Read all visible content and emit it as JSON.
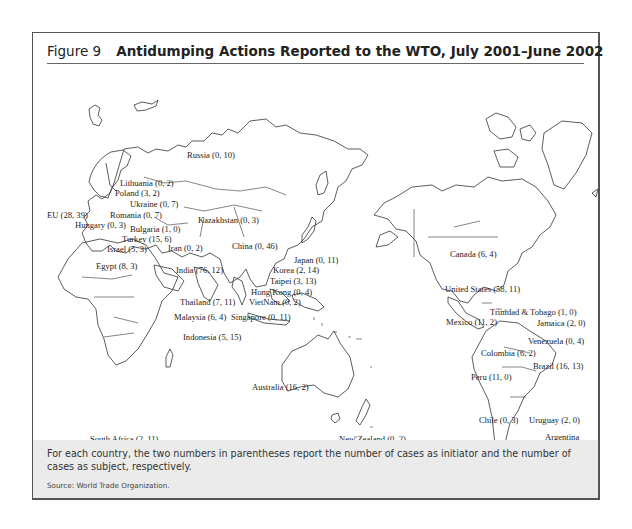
{
  "figure": {
    "number": "Figure 9",
    "title": "Antidumping Actions Reported to the WTO, July 2001–June 2002"
  },
  "map": {
    "type": "world-outline-map",
    "value_format": "(initiator cases, subject cases)",
    "labels": [
      {
        "id": "russia",
        "name": "Russia",
        "initiator": 0,
        "subject": 10,
        "text": "Russia (0, 10)"
      },
      {
        "id": "lithuania",
        "name": "Lithuania",
        "initiator": 0,
        "subject": 2,
        "text": "Lithuania (0, 2)"
      },
      {
        "id": "poland",
        "name": "Poland",
        "initiator": 3,
        "subject": 2,
        "text": "Poland (3, 2)"
      },
      {
        "id": "ukraine",
        "name": "Ukraine",
        "initiator": 0,
        "subject": 7,
        "text": "Ukraine (0, 7)"
      },
      {
        "id": "eu",
        "name": "EU",
        "initiator": 28,
        "subject": 39,
        "text": "EU (28, 39)"
      },
      {
        "id": "romania",
        "name": "Romania",
        "initiator": 0,
        "subject": 7,
        "text": "Romania (0, 7)"
      },
      {
        "id": "hungary",
        "name": "Hungary",
        "initiator": 0,
        "subject": 3,
        "text": "Hungary (0, 3)"
      },
      {
        "id": "kazakhstan",
        "name": "Kazakhstan",
        "initiator": 0,
        "subject": 3,
        "text": "Kazakhstan (0, 3)"
      },
      {
        "id": "bulgaria",
        "name": "Bulgaria",
        "initiator": 1,
        "subject": 0,
        "text": "Bulgaria (1, 0)"
      },
      {
        "id": "turkey",
        "name": "Turkey",
        "initiator": 15,
        "subject": 6,
        "text": "Turkey (15, 6)"
      },
      {
        "id": "israel",
        "name": "Israel",
        "initiator": 5,
        "subject": 3,
        "text": "Israel (5, 3)"
      },
      {
        "id": "iran",
        "name": "Iran",
        "initiator": 0,
        "subject": 2,
        "text": "Iran (0, 2)"
      },
      {
        "id": "china",
        "name": "China",
        "initiator": 0,
        "subject": 46,
        "text": "China (0, 46)"
      },
      {
        "id": "japan",
        "name": "Japan",
        "initiator": 0,
        "subject": 11,
        "text": "Japan (0, 11)"
      },
      {
        "id": "egypt",
        "name": "Egypt",
        "initiator": 8,
        "subject": 3,
        "text": "Egypt (8, 3)"
      },
      {
        "id": "india",
        "name": "India",
        "initiator": 76,
        "subject": 12,
        "text": "India (76, 12)"
      },
      {
        "id": "korea",
        "name": "Korea",
        "initiator": 2,
        "subject": 14,
        "text": "Korea (2, 14)"
      },
      {
        "id": "taipei",
        "name": "Taipei",
        "initiator": 3,
        "subject": 13,
        "text": "Taipei (3, 13)"
      },
      {
        "id": "hongkong",
        "name": "Hong Kong",
        "initiator": 0,
        "subject": 4,
        "text": "Hong Kong (0, 4)"
      },
      {
        "id": "thailand",
        "name": "Thailand",
        "initiator": 7,
        "subject": 11,
        "text": "Thailand (7, 11)"
      },
      {
        "id": "vietnam",
        "name": "VietNam",
        "initiator": 0,
        "subject": 2,
        "text": "VietNam (0, 2)"
      },
      {
        "id": "malaysia",
        "name": "Malaysia",
        "initiator": 6,
        "subject": 4,
        "text": "Malaysia (6, 4)"
      },
      {
        "id": "singapore",
        "name": "Singapore",
        "initiator": 0,
        "subject": 11,
        "text": "Singapore (0, 11)"
      },
      {
        "id": "indonesia",
        "name": "Indonesia",
        "initiator": 5,
        "subject": 15,
        "text": "Indonesia (5, 15)"
      },
      {
        "id": "australia",
        "name": "Australia",
        "initiator": 16,
        "subject": 2,
        "text": "Australia (16, 2)"
      },
      {
        "id": "southafrica",
        "name": "South Africa",
        "initiator": 2,
        "subject": 11,
        "text": "South Africa (2, 11)"
      },
      {
        "id": "newzealand",
        "name": "New Zealand",
        "initiator": 0,
        "subject": 2,
        "text": "New Zealand (0, 2)"
      },
      {
        "id": "canada",
        "name": "Canada",
        "initiator": 6,
        "subject": 4,
        "text": "Canada (6, 4)"
      },
      {
        "id": "unitedstates",
        "name": "United States",
        "initiator": 58,
        "subject": 11,
        "text": "United States (58, 11)"
      },
      {
        "id": "trinidad",
        "name": "Trinidad & Tobago",
        "initiator": 1,
        "subject": 0,
        "text": "Trinidad & Tobago (1, 0)"
      },
      {
        "id": "mexico",
        "name": "Mexico",
        "initiator": 11,
        "subject": 2,
        "text": "Mexico (11, 2)"
      },
      {
        "id": "jamaica",
        "name": "Jamaica",
        "initiator": 2,
        "subject": 0,
        "text": "Jamaica (2, 0)"
      },
      {
        "id": "venezuela",
        "name": "Venezuela",
        "initiator": 0,
        "subject": 4,
        "text": "Venezuela (0, 4)"
      },
      {
        "id": "colombia",
        "name": "Colombia",
        "initiator": 6,
        "subject": 2,
        "text": "Colombia (6, 2)"
      },
      {
        "id": "brazil",
        "name": "Brazil",
        "initiator": 16,
        "subject": 13,
        "text": "Brazil (16, 13)"
      },
      {
        "id": "peru",
        "name": "Peru",
        "initiator": 11,
        "subject": 0,
        "text": "Peru (11, 0)"
      },
      {
        "id": "chile",
        "name": "Chile",
        "initiator": 0,
        "subject": 3,
        "text": "Chile (0, 3)"
      },
      {
        "id": "uruguay",
        "name": "Uruguay",
        "initiator": 2,
        "subject": 0,
        "text": "Uruguay (2, 0)"
      },
      {
        "id": "argentina",
        "name": "Argentina",
        "initiator": 26,
        "subject": 4,
        "text_line1": "Argentina",
        "text_line2": "(26, 4)"
      }
    ]
  },
  "caption": {
    "note": "For each country, the two numbers in parentheses report the number of cases as initiator and the number of cases as subject, respectively.",
    "source": "Source: World Trade Organization."
  }
}
